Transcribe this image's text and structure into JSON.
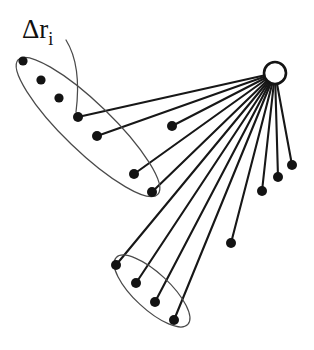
{
  "figure": {
    "name": "radial-spoke-displacement-diagram",
    "background_color": "#ffffff",
    "width": 314,
    "height": 350
  },
  "label": {
    "text": "Δr",
    "subscript": "i",
    "full": "Δr_i",
    "x": 22,
    "y": 38,
    "color": "#101010"
  },
  "leader": {
    "name": "label-leader-curve",
    "path": "M 66 40 C 76 56, 80 80, 76 112",
    "color": "#4a4a4a"
  },
  "hub": {
    "name": "hub-node",
    "cx": 275,
    "cy": 73,
    "r": 11,
    "fill": "#ffffff",
    "stroke": "#141414"
  },
  "colors": {
    "line": "#171717",
    "dot": "#131313",
    "ellipse": "#4a4a4a",
    "hub_fill": "#ffffff",
    "background": "#ffffff"
  },
  "groups": [
    {
      "name": "upper-group-ellipse",
      "cx": 88,
      "cy": 127,
      "rx": 97,
      "ry": 24,
      "rotation": 44,
      "member_count": 6
    },
    {
      "name": "lower-group-ellipse",
      "cx": 152,
      "cy": 291,
      "rx": 49,
      "ry": 18,
      "rotation": 43,
      "member_count": 4
    }
  ],
  "nodes": [
    {
      "id": "u1",
      "x": 23,
      "y": 61,
      "r": 4.6,
      "group": "upper",
      "connected": false
    },
    {
      "id": "u2",
      "x": 41,
      "y": 80,
      "r": 4.6,
      "group": "upper",
      "connected": false
    },
    {
      "id": "u3",
      "x": 59,
      "y": 98,
      "r": 4.6,
      "group": "upper",
      "connected": false
    },
    {
      "id": "u4",
      "x": 78,
      "y": 117,
      "r": 5.0,
      "group": "upper",
      "connected": true
    },
    {
      "id": "u5",
      "x": 97,
      "y": 136,
      "r": 5.0,
      "group": "upper",
      "connected": true
    },
    {
      "id": "u6",
      "x": 134,
      "y": 174,
      "r": 5.0,
      "group": "upper",
      "connected": true
    },
    {
      "id": "u7",
      "x": 152,
      "y": 192,
      "r": 5.0,
      "group": "upper",
      "connected": true
    },
    {
      "id": "m1",
      "x": 172,
      "y": 126,
      "r": 5.0,
      "group": "free",
      "connected": true
    },
    {
      "id": "m2",
      "x": 231,
      "y": 243,
      "r": 5.0,
      "group": "free",
      "connected": true
    },
    {
      "id": "r1",
      "x": 262,
      "y": 191,
      "r": 5.0,
      "group": "free",
      "connected": true
    },
    {
      "id": "r2",
      "x": 278,
      "y": 177,
      "r": 5.0,
      "group": "free",
      "connected": true
    },
    {
      "id": "r3",
      "x": 292,
      "y": 165,
      "r": 5.0,
      "group": "free",
      "connected": true
    },
    {
      "id": "l1",
      "x": 116,
      "y": 265,
      "r": 5.0,
      "group": "lower",
      "connected": true
    },
    {
      "id": "l2",
      "x": 136,
      "y": 283,
      "r": 5.0,
      "group": "lower",
      "connected": true
    },
    {
      "id": "l3",
      "x": 155,
      "y": 302,
      "r": 5.0,
      "group": "lower",
      "connected": true
    },
    {
      "id": "l4",
      "x": 174,
      "y": 320,
      "r": 5.0,
      "group": "lower",
      "connected": true
    }
  ],
  "spokes": [
    {
      "name": "spoke-to-u4",
      "x1": 275,
      "y1": 73,
      "x2": 78,
      "y2": 117
    },
    {
      "name": "spoke-to-u5",
      "x1": 275,
      "y1": 73,
      "x2": 97,
      "y2": 136
    },
    {
      "name": "spoke-to-m1",
      "x1": 275,
      "y1": 73,
      "x2": 172,
      "y2": 126
    },
    {
      "name": "spoke-to-u6",
      "x1": 275,
      "y1": 73,
      "x2": 134,
      "y2": 174
    },
    {
      "name": "spoke-to-u7",
      "x1": 275,
      "y1": 73,
      "x2": 152,
      "y2": 192
    },
    {
      "name": "spoke-to-l1",
      "x1": 275,
      "y1": 73,
      "x2": 116,
      "y2": 265
    },
    {
      "name": "spoke-to-l2",
      "x1": 275,
      "y1": 73,
      "x2": 136,
      "y2": 283
    },
    {
      "name": "spoke-to-l3",
      "x1": 275,
      "y1": 73,
      "x2": 155,
      "y2": 302
    },
    {
      "name": "spoke-to-l4",
      "x1": 275,
      "y1": 73,
      "x2": 174,
      "y2": 320
    },
    {
      "name": "spoke-to-m2",
      "x1": 275,
      "y1": 73,
      "x2": 231,
      "y2": 243
    },
    {
      "name": "spoke-to-r1",
      "x1": 275,
      "y1": 73,
      "x2": 262,
      "y2": 191
    },
    {
      "name": "spoke-to-r2",
      "x1": 275,
      "y1": 73,
      "x2": 278,
      "y2": 177
    },
    {
      "name": "spoke-to-r3",
      "x1": 275,
      "y1": 73,
      "x2": 292,
      "y2": 165
    }
  ]
}
